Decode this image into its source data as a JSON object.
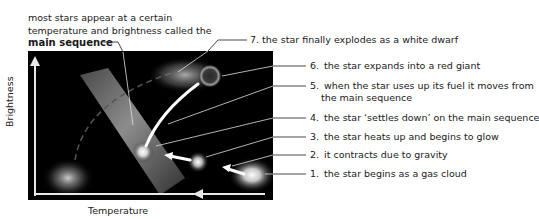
{
  "diagram": {
    "intro_text": {
      "line1": "most stars appear at a certain",
      "line2": "temperature and brightness called the",
      "bold": "main sequence"
    },
    "axes": {
      "y_label": "Brightness",
      "x_label": "Temperature"
    },
    "stages": [
      {
        "number": "1.",
        "text": "the star begins as a gas cloud"
      },
      {
        "number": "2.",
        "text": "it contracts due to gravity"
      },
      {
        "number": "3.",
        "text": "the star heats up and begins to glow"
      },
      {
        "number": "4.",
        "text": "the star ‘settles down’ on the main sequence"
      },
      {
        "number": "5.",
        "text": "when the star uses up its fuel it moves from",
        "text_cont": "the main sequence"
      },
      {
        "number": "6.",
        "text": "the star expands into a red giant"
      },
      {
        "number": "7.",
        "text": "the star finally explodes as a white dwarf"
      }
    ],
    "colors": {
      "panel_background": "#000000",
      "axis_color": "#e8e8e8",
      "leader_line": "#333333",
      "main_sequence_band": "#9a9a9a"
    }
  }
}
